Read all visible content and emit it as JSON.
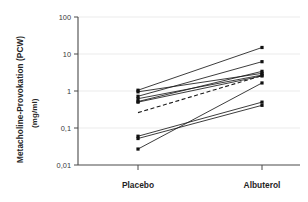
{
  "chart_data": {
    "type": "line",
    "subtype": "paired-slope-plot",
    "title": "",
    "xlabel": "",
    "ylabel": "Metacholine-Provokation (PCW) (mg/ml)",
    "ylabel_lines": [
      "Metacholine-Provokation (PCW)",
      "(mg/ml)"
    ],
    "categories": [
      "Placebo",
      "Albuterol"
    ],
    "x": [
      0,
      1
    ],
    "yscale": "log",
    "ylim": [
      0.01,
      100
    ],
    "ytick_values": [
      100,
      10,
      1,
      0.1,
      0.01
    ],
    "ytick_labels": [
      "100",
      "10",
      "1",
      "0,1",
      "0,01"
    ],
    "grid": "horizontal-faint",
    "legend": "none",
    "decimal_separator": ",",
    "markers": "filled-square",
    "n_subjects": 9,
    "series": [
      {
        "name": "subject-1",
        "style": "solid",
        "values": [
          1.05,
          15.0
        ]
      },
      {
        "name": "subject-2",
        "style": "solid",
        "values": [
          0.72,
          6.2
        ]
      },
      {
        "name": "subject-3",
        "style": "solid",
        "values": [
          0.52,
          3.4
        ]
      },
      {
        "name": "subject-4",
        "style": "solid",
        "values": [
          0.95,
          3.0
        ]
      },
      {
        "name": "subject-5",
        "style": "solid",
        "values": [
          0.62,
          2.7
        ]
      },
      {
        "name": "subject-6",
        "style": "solid",
        "values": [
          0.5,
          2.55
        ]
      },
      {
        "name": "subject-7",
        "style": "solid",
        "values": [
          0.06,
          0.5
        ]
      },
      {
        "name": "subject-8",
        "style": "solid",
        "values": [
          0.052,
          0.41
        ]
      },
      {
        "name": "subject-9",
        "style": "solid",
        "values": [
          0.027,
          1.65
        ]
      },
      {
        "name": "mean",
        "style": "dashed",
        "values": [
          0.26,
          2.6
        ]
      }
    ]
  },
  "axis": {
    "placebo_label": "Placebo",
    "albuterol_label": "Albuterol"
  }
}
